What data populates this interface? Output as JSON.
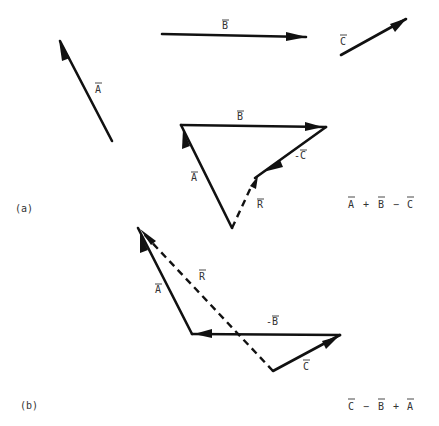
{
  "diagram": {
    "colors": {
      "ink": "#111111",
      "text": "#333333",
      "background": "#ffffff"
    },
    "given_vectors": [
      {
        "name": "A",
        "label": "A",
        "overbar": true
      },
      {
        "name": "B",
        "label": "B",
        "overbar": true
      },
      {
        "name": "C",
        "label": "C",
        "overbar": true
      }
    ],
    "part_a": {
      "tag": "(a)",
      "expression": "A + B − C",
      "expression_parts": [
        "A",
        "+",
        "B",
        "−",
        "C"
      ],
      "labels": {
        "a": "A",
        "b": "B",
        "neg_c": "-C",
        "r": "R"
      }
    },
    "part_b": {
      "tag": "(b)",
      "expression": "C − B + A",
      "expression_parts": [
        "C",
        "−",
        "B",
        "+",
        "A"
      ],
      "labels": {
        "a": "A",
        "neg_b": "-B",
        "c": "C",
        "r": "R"
      }
    }
  }
}
